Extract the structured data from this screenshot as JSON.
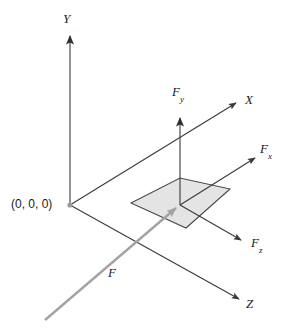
{
  "figure": {
    "background_color": "#ffffff",
    "axis_color": "#3a3a3a",
    "force_vector_color": "#9a9a9a",
    "plane_fill_color": "#e3e3e3",
    "plane_stroke_color": "#4a4a4a",
    "text_color": "#1a1a1a"
  },
  "labels": {
    "y_axis": "Y",
    "x_axis": "X",
    "z_axis": "Z",
    "origin": "(0, 0, 0)",
    "force_y": "F",
    "force_y_sub": "y",
    "force_x": "F",
    "force_x_sub": "x",
    "force_z": "F",
    "force_z_sub": "z",
    "force": "F"
  },
  "geometry": {
    "origin_point": {
      "x": 70,
      "y": 205
    },
    "application_point": {
      "x": 180,
      "y": 205
    },
    "y_axis_tip": {
      "x": 70,
      "y": 30
    },
    "x_axis_tip": {
      "x": 240,
      "y": 100
    },
    "z_axis_tip": {
      "x": 243,
      "y": 302
    },
    "force_y_tip": {
      "x": 180,
      "y": 112
    },
    "force_x_tip": {
      "x": 259,
      "y": 155
    },
    "force_z_tip": {
      "x": 245,
      "y": 243
    },
    "force_tail": {
      "x": 45,
      "y": 320
    },
    "plane_corners": [
      {
        "x": 131,
        "y": 203
      },
      {
        "x": 180,
        "y": 178
      },
      {
        "x": 230,
        "y": 189
      },
      {
        "x": 186,
        "y": 228
      }
    ]
  }
}
